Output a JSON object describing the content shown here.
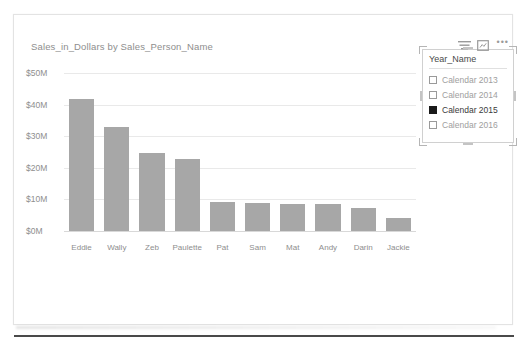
{
  "chart_data": {
    "type": "bar",
    "title": "Sales_in_Dollars by Sales_Person_Name",
    "xlabel": "",
    "ylabel": "",
    "categories": [
      "Eddie",
      "Wally",
      "Zeb",
      "Paulette",
      "Pat",
      "Sam",
      "Mat",
      "Andy",
      "Darin",
      "Jackie"
    ],
    "values": [
      41.8,
      33.0,
      24.7,
      22.8,
      9.2,
      8.8,
      8.6,
      8.5,
      7.4,
      4.1
    ],
    "ylim": [
      0,
      50
    ],
    "yticks": [
      0,
      10,
      20,
      30,
      40,
      50
    ],
    "ytick_labels": [
      "$0M",
      "$10M",
      "$20M",
      "$30M",
      "$40M",
      "$50M"
    ],
    "grid": true,
    "legend": "none",
    "bar_color": "#a7a7a7",
    "value_unit": "M",
    "value_prefix": "$"
  },
  "slicer": {
    "title": "Year_Name",
    "items": [
      {
        "label": "Calendar 2013",
        "selected": false
      },
      {
        "label": "Calendar 2014",
        "selected": false
      },
      {
        "label": "Calendar 2015",
        "selected": true
      },
      {
        "label": "Calendar 2016",
        "selected": false
      }
    ],
    "header_icons": {
      "filter": "filter-icon",
      "focus": "focus-mode-icon",
      "more": "•••"
    },
    "selected": true
  },
  "theme": {
    "bar_color": "#a7a7a7",
    "gridline_color": "#e9e9e9",
    "axis_text_color": "#8e8e8e",
    "title_color": "#8e8e8e",
    "canvas_background": "#ffffff",
    "selection_handle_color": "#b5b5b5"
  }
}
